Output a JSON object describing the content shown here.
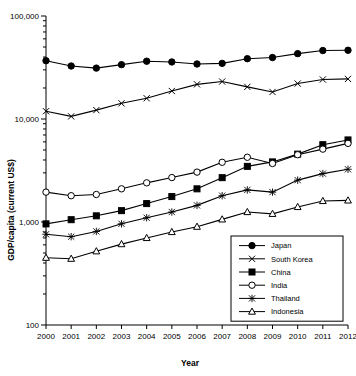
{
  "chart_data": {
    "type": "line",
    "title": "",
    "xlabel": "Year",
    "ylabel": "GDP/capita (current US$)",
    "x": [
      2000,
      2001,
      2002,
      2003,
      2004,
      2005,
      2006,
      2007,
      2008,
      2009,
      2010,
      2011,
      2012
    ],
    "xticklabels": [
      "2000",
      "2001",
      "2002",
      "2003",
      "2004",
      "2005",
      "2006",
      "2007",
      "2008",
      "2009",
      "2010",
      "2011",
      "2012"
    ],
    "yticklabels": [
      "100",
      "1,000",
      "10,000",
      "100,000"
    ],
    "ytickvalues": [
      100,
      1000,
      10000,
      100000
    ],
    "ylim": [
      100,
      100000
    ],
    "yscale": "log",
    "grid": false,
    "legend_position": "bottom-right",
    "series": [
      {
        "name": "Japan",
        "marker": "filled-circle",
        "values": [
          36800,
          32700,
          31200,
          33700,
          36400,
          35800,
          34200,
          34700,
          38500,
          39500,
          43100,
          46200,
          46500
        ]
      },
      {
        "name": "South Korea",
        "marker": "cross-x",
        "values": [
          11900,
          10600,
          12200,
          14200,
          15900,
          18700,
          21700,
          23100,
          20500,
          18300,
          22100,
          24200,
          24500
        ]
      },
      {
        "name": "China",
        "marker": "filled-square",
        "values": [
          959,
          1053,
          1148,
          1289,
          1509,
          1766,
          2099,
          2694,
          3468,
          3832,
          4560,
          5633,
          6264
        ]
      },
      {
        "name": "India",
        "marker": "open-circle",
        "values": [
          1950,
          1800,
          1850,
          2100,
          2400,
          2700,
          3050,
          3800,
          4250,
          3700,
          4500,
          5100,
          5800
        ]
      },
      {
        "name": "Thailand",
        "marker": "asterisk",
        "values": [
          760,
          720,
          810,
          960,
          1100,
          1250,
          1450,
          1800,
          2050,
          1950,
          2550,
          2950,
          3250
        ]
      },
      {
        "name": "Indonesia",
        "marker": "open-triangle",
        "values": [
          450,
          440,
          520,
          610,
          700,
          800,
          900,
          1060,
          1250,
          1200,
          1400,
          1600,
          1620
        ]
      }
    ]
  },
  "legend": {
    "entries": [
      "Japan",
      "South Korea",
      "China",
      "India",
      "Thailand",
      "Indonesia"
    ]
  }
}
